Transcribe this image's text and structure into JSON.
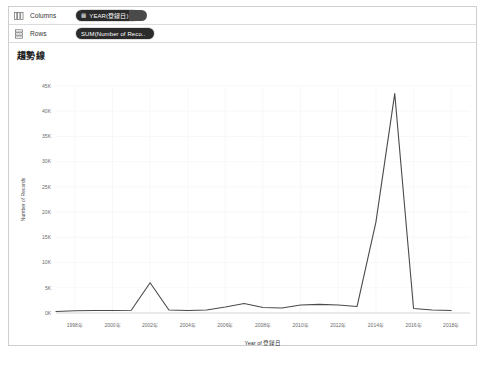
{
  "window": {
    "title": "趨勢線"
  },
  "shelves": [
    {
      "name": "columns",
      "icon": "columns-grid-icon",
      "label": "Columns",
      "pill": {
        "glyph": "▦",
        "text": "YEAR(登録日)",
        "has_tail": true
      }
    },
    {
      "name": "rows",
      "icon": "rows-grid-icon",
      "label": "Rows",
      "pill": {
        "glyph": "",
        "text": "SUM(Number of Reco..",
        "has_tail": false
      }
    }
  ],
  "chart_data": {
    "type": "line",
    "title": "趨勢線",
    "xlabel": "Year of 登録日",
    "ylabel": "Number of Records",
    "ylim": [
      0,
      45000
    ],
    "yticks": [
      0,
      5000,
      10000,
      15000,
      20000,
      25000,
      30000,
      35000,
      40000,
      45000
    ],
    "ytick_labels": [
      "0K",
      "5K",
      "10K",
      "15K",
      "20K",
      "25K",
      "30K",
      "35K",
      "40K",
      "45K"
    ],
    "xlim": [
      1997,
      2019
    ],
    "xticks": [
      1998,
      2000,
      2002,
      2004,
      2006,
      2008,
      2010,
      2012,
      2014,
      2016,
      2018
    ],
    "xtick_labels": [
      "1998年",
      "2000年",
      "2002年",
      "2004年",
      "2006年",
      "2008年",
      "2010年",
      "2012年",
      "2014年",
      "2016年",
      "2018年"
    ],
    "grid": true,
    "legend": "none",
    "line_color": "#4a4a4a",
    "x": [
      1997,
      1998,
      1999,
      2000,
      2001,
      2002,
      2003,
      2004,
      2005,
      2006,
      2007,
      2008,
      2009,
      2010,
      2011,
      2012,
      2013,
      2014,
      2015,
      2016,
      2017,
      2018
    ],
    "values": [
      300,
      450,
      500,
      500,
      550,
      6000,
      600,
      500,
      600,
      1200,
      1900,
      1100,
      1000,
      1600,
      1700,
      1600,
      1300,
      18000,
      43500,
      900,
      600,
      500
    ],
    "series": [
      {
        "name": "Number of Records",
        "values": [
          300,
          450,
          500,
          500,
          550,
          6000,
          600,
          500,
          600,
          1200,
          1900,
          1100,
          1000,
          1600,
          1700,
          1600,
          1300,
          18000,
          43500,
          900,
          600,
          500
        ]
      }
    ]
  }
}
